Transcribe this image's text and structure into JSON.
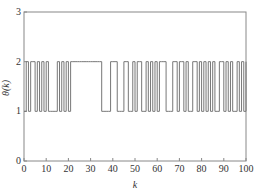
{
  "chart_data": {
    "type": "line",
    "step": true,
    "title": "",
    "xlabel": "k",
    "ylabel": "θ(k)",
    "xlim": [
      0,
      100
    ],
    "ylim": [
      0,
      3
    ],
    "xticks": [
      0,
      10,
      20,
      30,
      40,
      50,
      60,
      70,
      80,
      90,
      100
    ],
    "yticks": [
      0,
      1,
      2,
      3
    ],
    "grid": false,
    "series": [
      {
        "name": "θ(k)",
        "x": [
          0,
          1,
          2,
          3,
          4,
          5,
          6,
          7,
          8,
          9,
          10,
          11,
          12,
          13,
          14,
          15,
          16,
          17,
          18,
          19,
          20,
          21,
          22,
          23,
          24,
          25,
          26,
          27,
          28,
          29,
          30,
          31,
          32,
          33,
          34,
          35,
          36,
          37,
          38,
          39,
          40,
          41,
          42,
          43,
          44,
          45,
          46,
          47,
          48,
          49,
          50,
          51,
          52,
          53,
          54,
          55,
          56,
          57,
          58,
          59,
          60,
          61,
          62,
          63,
          64,
          65,
          66,
          67,
          68,
          69,
          70,
          71,
          72,
          73,
          74,
          75,
          76,
          77,
          78,
          79,
          80,
          81,
          82,
          83,
          84,
          85,
          86,
          87,
          88,
          89,
          90,
          91,
          92,
          93,
          94,
          95,
          96,
          97,
          98,
          99,
          100
        ],
        "values": [
          1,
          2,
          1,
          2,
          2,
          1,
          2,
          1,
          2,
          1,
          2,
          1,
          1,
          1,
          1,
          2,
          1,
          2,
          1,
          2,
          1,
          2,
          2,
          2,
          2,
          2,
          2,
          2,
          2,
          2,
          2,
          2,
          2,
          2,
          2,
          1,
          1,
          1,
          1,
          2,
          2,
          2,
          1,
          1,
          1,
          2,
          2,
          1,
          1,
          2,
          1,
          2,
          2,
          1,
          1,
          2,
          1,
          2,
          1,
          2,
          1,
          2,
          2,
          2,
          1,
          1,
          1,
          2,
          2,
          1,
          2,
          2,
          1,
          2,
          1,
          1,
          2,
          2,
          1,
          2,
          1,
          2,
          1,
          2,
          1,
          2,
          1,
          1,
          2,
          2,
          1,
          2,
          1,
          2,
          1,
          1,
          2,
          1,
          2,
          1,
          2
        ]
      }
    ]
  }
}
